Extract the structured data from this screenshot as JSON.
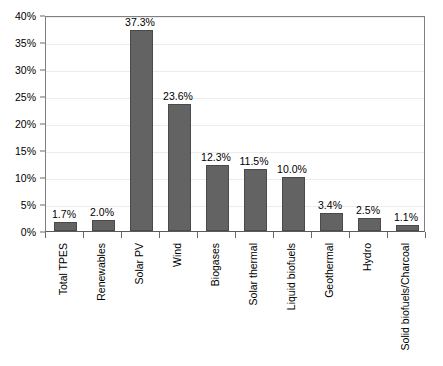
{
  "chart_data": {
    "type": "bar",
    "title": "",
    "xlabel": "",
    "ylabel": "",
    "ylim": [
      0,
      40
    ],
    "ytick_step": 5,
    "grid": true,
    "legend": null,
    "bar_color": "#636363",
    "categories": [
      "Total TPES",
      "Renewables",
      "Solar PV",
      "Wind",
      "Biogases",
      "Solar thermal",
      "Liquid biofuels",
      "Geothermal",
      "Hydro",
      "Solid biofuels/Charcoal"
    ],
    "values": [
      1.7,
      2.0,
      37.3,
      23.6,
      12.3,
      11.5,
      10.0,
      3.4,
      2.5,
      1.1
    ],
    "data_labels": [
      "1.7%",
      "2.0%",
      "37.3%",
      "23.6%",
      "12.3%",
      "11.5%",
      "10.0%",
      "3.4%",
      "2.5%",
      "1.1%"
    ],
    "ytick_labels": [
      "0%",
      "5%",
      "10%",
      "15%",
      "20%",
      "25%",
      "30%",
      "35%",
      "40%"
    ],
    "ytick_values": [
      0,
      5,
      10,
      15,
      20,
      25,
      30,
      35,
      40
    ]
  }
}
